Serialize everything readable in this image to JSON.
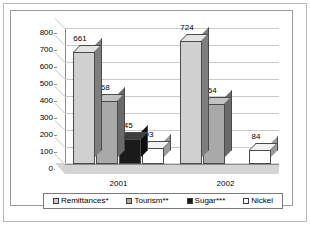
{
  "chart_data": {
    "type": "bar",
    "title": "",
    "subtitle": "",
    "xlabel": "",
    "ylabel": "",
    "categories": [
      "2001",
      "2002"
    ],
    "series": [
      {
        "name": "Remittances*",
        "values": [
          661,
          724
        ],
        "color": "#d0d0d0"
      },
      {
        "name": "Tourism**",
        "values": [
          368,
          354
        ],
        "color": "#a9a9a9"
      },
      {
        "name": "Sugar***",
        "values": [
          145,
          null
        ],
        "color": "#1a1a1a"
      },
      {
        "name": "Nickel",
        "values": [
          93,
          84
        ],
        "color": "#ffffff"
      }
    ],
    "ylim": [
      0,
      800
    ],
    "ytick_values": [
      0,
      100,
      200,
      300,
      400,
      500,
      600,
      700,
      800
    ],
    "ytick_labels": [
      "0",
      "100",
      "200",
      "300",
      "400",
      "500",
      "600",
      "700",
      "800"
    ],
    "grid": true,
    "legend_position": "bottom",
    "three_d": true,
    "data_labels": [
      "661",
      "368",
      "145",
      "93",
      "724",
      "354",
      "84"
    ]
  },
  "axis": {
    "y": {
      "labels": [
        "800",
        "700",
        "600",
        "500",
        "400",
        "300",
        "200",
        "100",
        "0"
      ]
    },
    "x": {
      "labels": [
        "2001",
        "2002"
      ]
    }
  },
  "legend": {
    "items": [
      {
        "label": "Remittances*",
        "swatch": "legend-swatch-remittances"
      },
      {
        "label": "Tourism**",
        "swatch": "legend-swatch-tourism"
      },
      {
        "label": "Sugar***",
        "swatch": "legend-swatch-sugar"
      },
      {
        "label": "Nickel",
        "swatch": "legend-swatch-nickel"
      }
    ]
  }
}
